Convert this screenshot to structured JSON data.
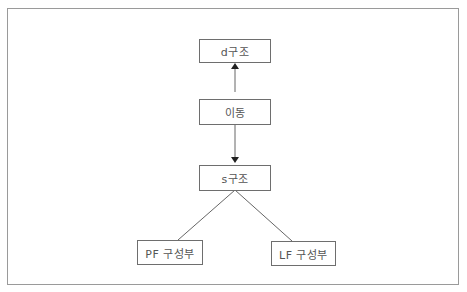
{
  "diagram": {
    "nodes": {
      "d_structure": "d구조",
      "movement": "이동",
      "s_structure": "s구조",
      "pf_component": "PF 구성부",
      "lf_component": "LF 구성부"
    },
    "edges": [
      {
        "from": "movement",
        "to": "d_structure",
        "type": "arrow"
      },
      {
        "from": "movement",
        "to": "s_structure",
        "type": "arrow"
      },
      {
        "from": "s_structure",
        "to": "pf_component",
        "type": "line"
      },
      {
        "from": "s_structure",
        "to": "lf_component",
        "type": "line"
      }
    ],
    "colors": {
      "border": "#6e6e6e",
      "frame": "#9a9a9a",
      "text": "#555555"
    }
  }
}
